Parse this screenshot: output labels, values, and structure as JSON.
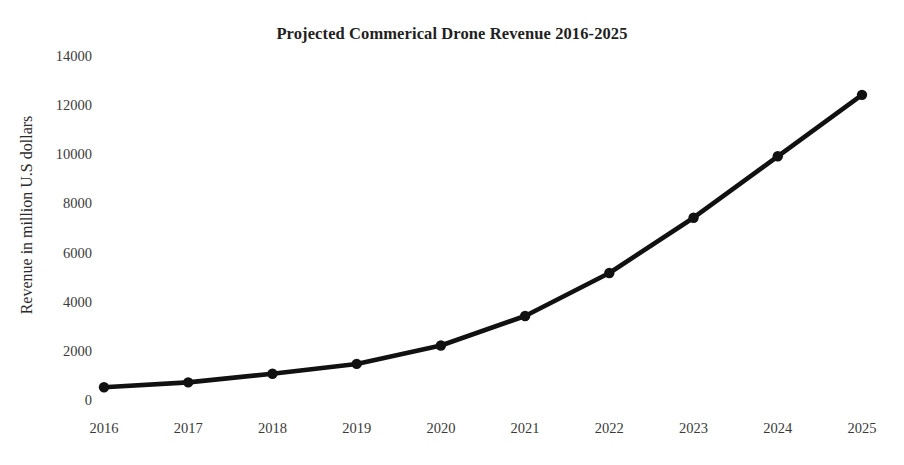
{
  "chart_data": {
    "type": "line",
    "title": "Projected Commerical Drone Revenue 2016-2025",
    "xlabel": "",
    "ylabel": "Revenue in million U.S dollars",
    "categories": [
      "2016",
      "2017",
      "2018",
      "2019",
      "2020",
      "2021",
      "2022",
      "2023",
      "2024",
      "2025"
    ],
    "values": [
      600,
      800,
      1150,
      1550,
      2300,
      3500,
      5250,
      7500,
      10000,
      12500
    ],
    "series": [
      {
        "name": "Projected commercial drone revenue",
        "values": [
          600,
          800,
          1150,
          1550,
          2300,
          3500,
          5250,
          7500,
          10000,
          12500
        ]
      }
    ],
    "ylim": [
      0,
      14000
    ],
    "yticks": [
      0,
      2000,
      4000,
      6000,
      8000,
      10000,
      12000,
      14000
    ],
    "ytick_labels": [
      "0",
      "2000",
      "4000",
      "6000",
      "8000",
      "10000",
      "12000",
      "14000"
    ],
    "xtick_labels": [
      "2016",
      "2017",
      "2018",
      "2019",
      "2020",
      "2021",
      "2022",
      "2023",
      "2024",
      "2025"
    ],
    "grid": false,
    "legend": "none",
    "line_color": "#111111",
    "marker_color": "#111111",
    "marker_shape": "circle",
    "background_color": "#ffffff"
  },
  "layout": {
    "plot_left": 104,
    "plot_right": 862,
    "y_zero_px": 402,
    "y_top_px": 58,
    "y_top_value": 14000,
    "line_width": 4.6,
    "marker_radius": 5.2
  }
}
